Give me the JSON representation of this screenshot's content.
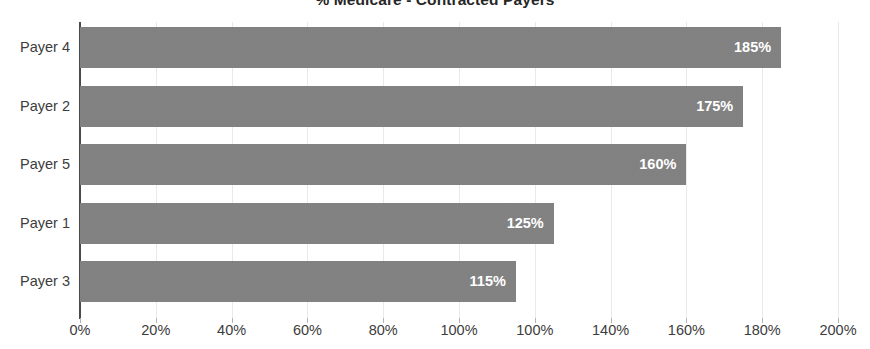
{
  "chart_data": {
    "type": "bar",
    "orientation": "horizontal",
    "title": "% Medicare - Contracted Payers",
    "xlabel": "",
    "ylabel": "",
    "categories": [
      "Payer 4",
      "Payer 2",
      "Payer 5",
      "Payer 1",
      "Payer 3"
    ],
    "values": [
      185,
      175,
      160,
      125,
      115
    ],
    "data_labels": [
      "185%",
      "175%",
      "160%",
      "125%",
      "115%"
    ],
    "xlim": [
      0,
      200
    ],
    "xtick_values": [
      0,
      20,
      40,
      60,
      80,
      100,
      120,
      140,
      160,
      180,
      200
    ],
    "xtick_labels": [
      "0%",
      "20%",
      "40%",
      "60%",
      "80%",
      "100%",
      "100%",
      "140%",
      "160%",
      "180%",
      "200%"
    ],
    "grid": true,
    "legend": "none",
    "bar_color": "#808080",
    "data_label_color": "#ffffff",
    "axis_text_color": "#3c3c3c",
    "gridline_color": "#e9e9e9",
    "title_color": "#262626",
    "background_color": "#ffffff"
  }
}
